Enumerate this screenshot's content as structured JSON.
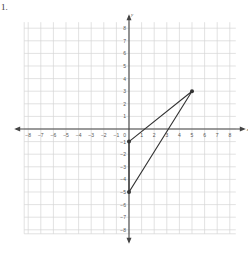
{
  "problem": {
    "label": "1."
  },
  "colors": {
    "grid": "#d6d6d6",
    "axis": "#444444",
    "triangle": "#333333",
    "background": "#ffffff"
  },
  "chart_data": {
    "type": "scatter",
    "title": "",
    "xlabel": "x",
    "ylabel": "y",
    "xlim": [
      -8,
      8
    ],
    "ylim": [
      -8,
      8
    ],
    "grid": true,
    "x_ticks": [
      -8,
      -7,
      -6,
      -5,
      -4,
      -3,
      -2,
      -1,
      1,
      2,
      3,
      4,
      5,
      6,
      7,
      8
    ],
    "y_ticks": [
      8,
      7,
      6,
      5,
      4,
      3,
      2,
      1,
      -1,
      -2,
      -3,
      -4,
      -5,
      -6,
      -7,
      -8
    ],
    "shapes": [
      {
        "type": "triangle",
        "vertices": [
          [
            0,
            -1
          ],
          [
            5,
            3
          ],
          [
            0,
            -5
          ]
        ]
      }
    ],
    "points": [
      {
        "x": 0,
        "y": -1
      },
      {
        "x": 5,
        "y": 3
      },
      {
        "x": 0,
        "y": -5
      }
    ]
  }
}
